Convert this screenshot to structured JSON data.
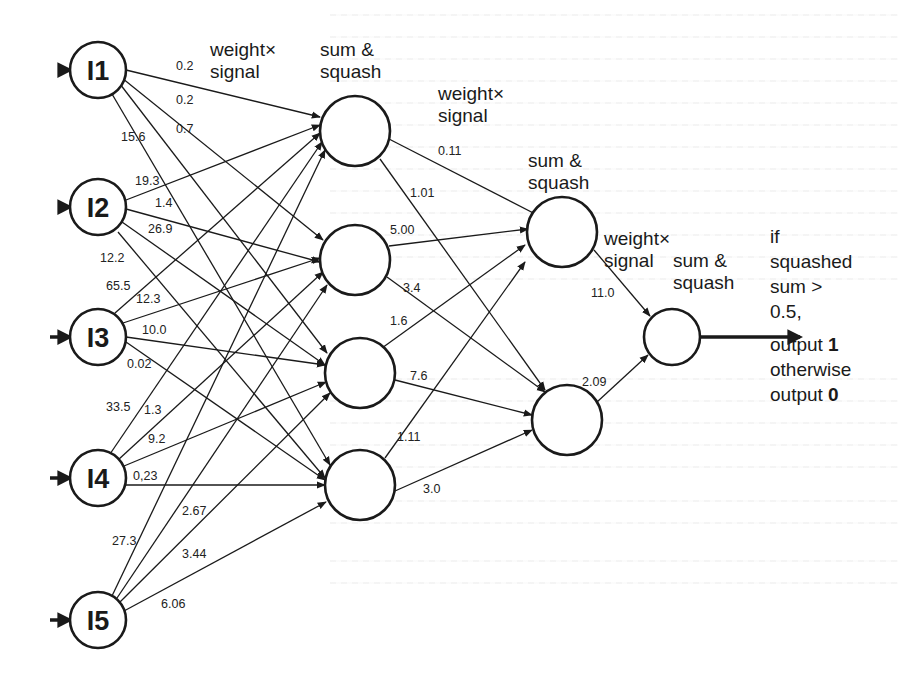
{
  "diagram": {
    "type": "feedforward-neural-network",
    "input_nodes": [
      {
        "id": "I1",
        "label": "I1"
      },
      {
        "id": "I2",
        "label": "I2"
      },
      {
        "id": "I3",
        "label": "I3"
      },
      {
        "id": "I4",
        "label": "I4"
      },
      {
        "id": "I5",
        "label": "I5"
      }
    ],
    "hidden_layer_1_count": 4,
    "hidden_layer_2_count": 2,
    "output_nodes": 1,
    "captions": {
      "weight_signal_1": [
        "weight×",
        "signal"
      ],
      "sum_squash_1": [
        "sum &",
        "squash"
      ],
      "weight_signal_2": [
        "weight×",
        "signal"
      ],
      "sum_squash_2": [
        "sum &",
        "squash"
      ],
      "weight_signal_3": [
        "weight×",
        "signal"
      ],
      "sum_squash_3": [
        "sum &",
        "squash"
      ]
    },
    "input_to_hidden_weights": {
      "I1": [
        "0.2",
        "0.2",
        "0.7",
        "15.6"
      ],
      "I2": [
        "19.3",
        "1.4",
        "26.9",
        "12.2"
      ],
      "I3": [
        "65.5",
        "12.3",
        "10.0",
        "0.02"
      ],
      "I4": [
        "33.5",
        "1.3",
        "9.2",
        "0.23"
      ],
      "I5": [
        "27.3",
        "2.67",
        "3.44",
        "6.06"
      ]
    },
    "hidden_to_hidden_weights": [
      "0.11",
      "1.01",
      "5.00",
      "3.4",
      "1.6",
      "7.6",
      "1.11",
      "3.0"
    ],
    "hidden_to_output_weights": [
      "11.0",
      "2.09"
    ],
    "output_rule": {
      "lines": [
        "if",
        "squashed",
        "sum >",
        "0.5,",
        "output ",
        "otherwise",
        "output "
      ],
      "value_one": "1",
      "value_zero": "0"
    }
  },
  "labels": {
    "w_I1_H1": "0.2",
    "w_I1_H2": "0.2",
    "w_I1_H3": "0.7",
    "w_I1_H4": "15.6",
    "w_I2_H1": "19.3",
    "w_I2_H2": "1.4",
    "w_I2_H3": "26.9",
    "w_I2_H4": "12.2",
    "w_I3_H1": "65.5",
    "w_I3_H2": "12.3",
    "w_I3_H3": "10.0",
    "w_I3_H4": "0.02",
    "w_I4_H1": "33.5",
    "w_I4_H2": "1.3",
    "w_I4_H3": "9.2",
    "w_I4_H4": "0,23",
    "w_I5_H1": "27.3",
    "w_I5_H2": "2.67",
    "w_I5_H3": "3.44",
    "w_I5_H4": "6.06",
    "w_H1_J1": "0.11",
    "w_H1_J2": "1.01",
    "w_H2_J1": "5.00",
    "w_H2_J2": "3.4",
    "w_H3_J1": "1.6",
    "w_H3_J2": "7.6",
    "w_H4_J1": "1.11",
    "w_H4_J2": "3.0",
    "w_J1_O": "11.0",
    "w_J2_O": "2.09"
  }
}
